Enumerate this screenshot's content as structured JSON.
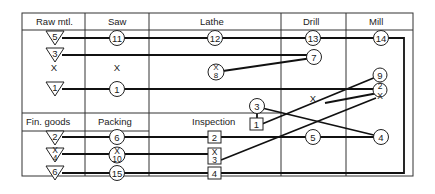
{
  "columns": [
    {
      "id": "raw",
      "label": "Raw mtl."
    },
    {
      "id": "saw",
      "label": "Saw"
    },
    {
      "id": "lathe",
      "label": "Lathe"
    },
    {
      "id": "drill",
      "label": "Drill"
    },
    {
      "id": "mill",
      "label": "Mill"
    }
  ],
  "lower_columns": [
    {
      "id": "fin",
      "label": "Fin. goods"
    },
    {
      "id": "packing",
      "label": "Packing"
    },
    {
      "id": "inspection",
      "label": "Inspection"
    }
  ],
  "nodes": {
    "raw_5": "5",
    "raw_3": "3",
    "raw_x": "X",
    "raw_1": "1",
    "saw_11": "11",
    "saw_x": "X",
    "saw_1": "1",
    "lathe_12": "12",
    "lathe_8": "8",
    "lathe_8_x": "X",
    "lathe_3": "3",
    "drill_13": "13",
    "drill_7": "7",
    "drill_x": "X",
    "drill_5": "5",
    "mill_14": "14",
    "mill_9": "9",
    "mill_2": "2",
    "mill_x": "X",
    "mill_4": "4",
    "fin_2": "2",
    "fin_x": "X",
    "fin_4": "4",
    "fin_6": "6",
    "pack_6": "6",
    "pack_x": "X",
    "pack_10": "10",
    "pack_15": "15",
    "insp_1": "1",
    "insp_2": "2",
    "insp_x": "X",
    "insp_3": "3",
    "insp_4": "4"
  },
  "colors": {
    "line": "#111111",
    "grid": "#333333",
    "background": "#ffffff"
  }
}
